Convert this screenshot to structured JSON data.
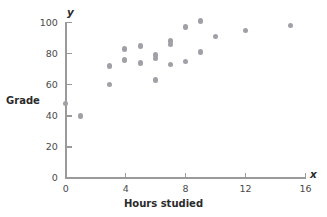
{
  "chart_data": {
    "type": "scatter",
    "title": "",
    "xlabel": "Hours studied",
    "ylabel": "Grade",
    "x_axis_symbol": "x",
    "y_axis_symbol": "y",
    "xlim": [
      0,
      16
    ],
    "ylim": [
      0,
      100
    ],
    "xticks": [
      0,
      4,
      8,
      12,
      16
    ],
    "yticks": [
      0,
      20,
      40,
      60,
      80,
      100
    ],
    "xtick_labels": [
      "0",
      "4",
      "8",
      "12",
      "16"
    ],
    "ytick_labels": [
      "0",
      "20",
      "40",
      "60",
      "80",
      "100"
    ],
    "grid": false,
    "legend": null,
    "marker_color": "#a0a0a6",
    "axis_color": "#9a9a9a",
    "points": [
      {
        "x": 0.0,
        "y": 48
      },
      {
        "x": 1.0,
        "y": 40
      },
      {
        "x": 2.9,
        "y": 72
      },
      {
        "x": 2.9,
        "y": 60
      },
      {
        "x": 3.9,
        "y": 83
      },
      {
        "x": 3.9,
        "y": 76
      },
      {
        "x": 5.0,
        "y": 85
      },
      {
        "x": 5.0,
        "y": 74
      },
      {
        "x": 6.0,
        "y": 79
      },
      {
        "x": 6.0,
        "y": 77
      },
      {
        "x": 6.0,
        "y": 63
      },
      {
        "x": 7.0,
        "y": 88
      },
      {
        "x": 7.0,
        "y": 86
      },
      {
        "x": 7.0,
        "y": 73
      },
      {
        "x": 8.0,
        "y": 97
      },
      {
        "x": 8.0,
        "y": 75
      },
      {
        "x": 9.0,
        "y": 101
      },
      {
        "x": 9.0,
        "y": 81
      },
      {
        "x": 10.0,
        "y": 91
      },
      {
        "x": 12.0,
        "y": 95
      },
      {
        "x": 15.0,
        "y": 98
      }
    ]
  },
  "axis_titles": {
    "y": "Grade",
    "x": "Hours studied"
  },
  "axis_symbols": {
    "x": "x",
    "y": "y"
  }
}
